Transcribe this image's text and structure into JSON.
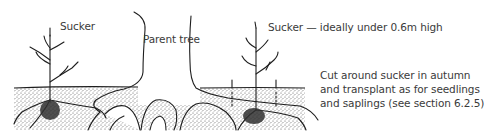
{
  "figure": {
    "labels": {
      "sucker_left": "Sucker",
      "parent_tree": "Parent tree",
      "sucker_right": "Sucker — ideally under 0.6m high"
    },
    "note": {
      "lines": [
        "Cut around sucker in autumn",
        "and transplant as for seedlings",
        "and saplings (see section 6.2.5)"
      ]
    },
    "colors": {
      "ink": "#1e1e1e",
      "text": "#3a3a3a",
      "soil": "#bdbdbd",
      "background": "#ffffff"
    }
  }
}
